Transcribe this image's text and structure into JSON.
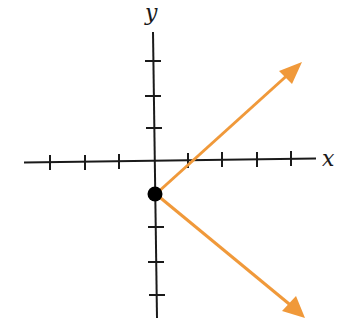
{
  "diagram": {
    "type": "coordinate-graph",
    "axes": {
      "x_label": "x",
      "y_label": "y",
      "x_ticks": [
        -3,
        -2,
        -1,
        1,
        2,
        3,
        4
      ],
      "y_ticks": [
        -3,
        -2,
        -1,
        1,
        2,
        3
      ]
    },
    "point": {
      "x": 0,
      "y": -1,
      "style": "filled"
    },
    "rays": [
      {
        "from": [
          0,
          -1
        ],
        "direction": [
          1,
          1
        ],
        "label": "upper-ray"
      },
      {
        "from": [
          0,
          -1
        ],
        "direction": [
          1,
          -1
        ],
        "label": "lower-ray"
      }
    ],
    "colors": {
      "axis": "#1a1a1a",
      "ray": "#f0993a",
      "point": "#000000",
      "background": "#ffffff"
    }
  }
}
